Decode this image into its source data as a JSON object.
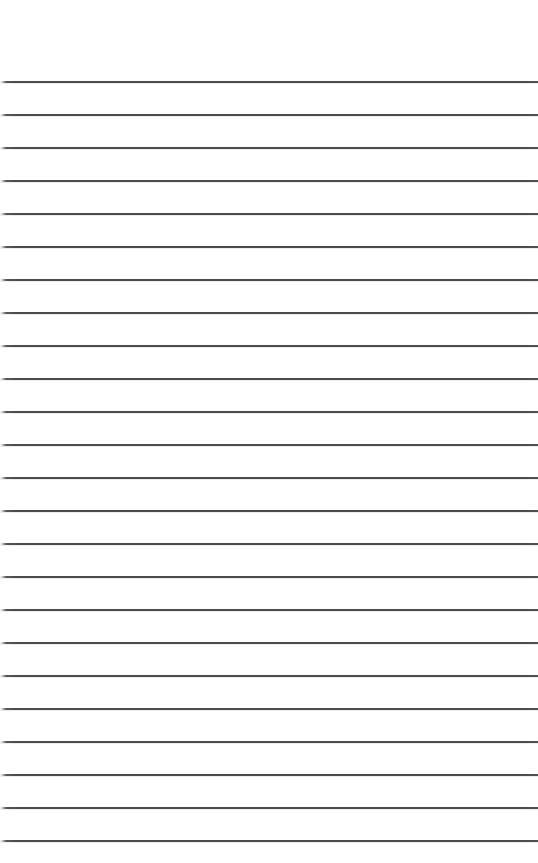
{
  "page": {
    "kind": "lined-paper-sheet",
    "width": 538,
    "height": 863,
    "background_color": "#ffffff",
    "has_text": false,
    "has_margin_rule": false,
    "has_punch_holes": false,
    "text_content": ""
  },
  "ruling": {
    "line_color": "#4a4a52",
    "line_thickness_px": 2,
    "line_count": 24,
    "first_line_y": 81,
    "last_line_y": 840,
    "line_spacing_px": 33,
    "left_inset_px": 0,
    "right_inset_px": 0,
    "left_fade_px": 6,
    "top_margin_px": 81,
    "bottom_margin_px": 23,
    "line_y_positions": [
      81,
      114,
      147,
      180,
      213,
      246,
      279,
      312,
      345,
      378,
      411,
      444,
      477,
      510,
      543,
      576,
      609,
      642,
      675,
      708,
      741,
      774,
      807,
      840
    ]
  }
}
